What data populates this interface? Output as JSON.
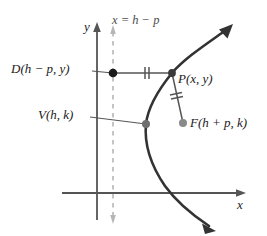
{
  "figure": {
    "type": "parabola-diagram",
    "background_color": "#ffffff",
    "axes": {
      "x_axis_label": "x",
      "y_axis_label": "y",
      "axis_color": "#555555",
      "origin_px": {
        "x": 97,
        "y": 193
      }
    },
    "directrix": {
      "label": "x = h − p",
      "style": "dashed",
      "color": "#b0b0b0",
      "x_px": 113
    },
    "curve": {
      "color": "#333333",
      "opens": "right-to-left",
      "description": "parabola opening to the right with vertex at V(h, k)"
    },
    "points": [
      {
        "name": "D",
        "label": "D(h − p, y)",
        "dot_color": "#1a1a1a",
        "px": {
          "x": 113,
          "y": 73
        }
      },
      {
        "name": "P",
        "label": "P(x, y)",
        "dot_color": "#333333",
        "px": {
          "x": 172,
          "y": 73
        }
      },
      {
        "name": "V",
        "label": "V(h, k)",
        "dot_color": "#6e6e6e",
        "px": {
          "x": 146,
          "y": 124
        }
      },
      {
        "name": "F",
        "label": "F(h + p, k)",
        "dot_color": "#8a8a8a",
        "px": {
          "x": 183,
          "y": 123
        }
      }
    ],
    "segments": [
      {
        "name": "DP",
        "tick_marks": 2,
        "from": "D",
        "to": "P"
      },
      {
        "name": "PF",
        "tick_marks": 2,
        "from": "P",
        "to": "F"
      }
    ]
  }
}
